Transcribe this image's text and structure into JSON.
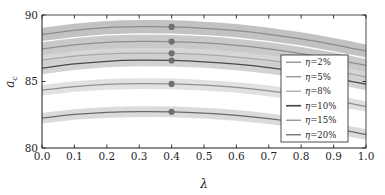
{
  "chart_data": {
    "type": "line",
    "title": "",
    "xlabel": "λ",
    "ylabel": "a_c",
    "xlim": [
      0.0,
      1.0
    ],
    "ylim": [
      80,
      90
    ],
    "grid": false,
    "legend_position": "center-right",
    "xticks": [
      "0.0",
      "0.1",
      "0.2",
      "0.3",
      "0.4",
      "0.5",
      "0.6",
      "0.7",
      "0.8",
      "0.9",
      "1.0"
    ],
    "xtick_values": [
      0.0,
      0.1,
      0.2,
      0.3,
      0.4,
      0.5,
      0.6,
      0.7,
      0.8,
      0.9,
      1.0
    ],
    "yticks": [
      "80",
      "85",
      "90"
    ],
    "ytick_values": [
      80,
      85,
      90
    ],
    "x": [
      0.0,
      0.1,
      0.2,
      0.3,
      0.4,
      0.5,
      0.6,
      0.7,
      0.8,
      0.9,
      1.0
    ],
    "marker_x": 0.4,
    "series": [
      {
        "name": "η=2%",
        "eta": "2%",
        "color": "#8d8d8d",
        "band_color": "#bdbdbd",
        "values": [
          88.55,
          88.85,
          89.05,
          89.12,
          89.1,
          89.0,
          88.82,
          88.55,
          88.2,
          87.78,
          87.3
        ],
        "band_low": [
          88.05,
          88.35,
          88.55,
          88.62,
          88.6,
          88.5,
          88.32,
          88.05,
          87.7,
          87.28,
          86.8
        ],
        "band_high": [
          89.05,
          89.35,
          89.55,
          89.62,
          89.6,
          89.5,
          89.32,
          89.05,
          88.7,
          88.28,
          87.8
        ],
        "marker_value": 89.1
      },
      {
        "name": "η=5%",
        "eta": "5%",
        "color": "#8f8f8f",
        "band_color": "#c4c4c4",
        "values": [
          87.45,
          87.75,
          87.95,
          88.02,
          88.0,
          87.9,
          87.72,
          87.45,
          87.1,
          86.68,
          86.2
        ],
        "band_low": [
          86.95,
          87.25,
          87.45,
          87.52,
          87.5,
          87.4,
          87.22,
          86.95,
          86.6,
          86.18,
          85.7
        ],
        "band_high": [
          87.95,
          88.25,
          88.45,
          88.52,
          88.5,
          88.4,
          88.22,
          87.95,
          87.6,
          87.18,
          86.7
        ],
        "marker_value": 88.0
      },
      {
        "name": "η=8%",
        "eta": "8%",
        "color": "#a8a8a8",
        "band_color": "#d3d3d3",
        "values": [
          86.6,
          86.9,
          87.08,
          87.14,
          87.12,
          87.02,
          86.84,
          86.58,
          86.24,
          85.82,
          85.35
        ],
        "band_low": [
          86.2,
          86.5,
          86.68,
          86.74,
          86.72,
          86.62,
          86.44,
          86.18,
          85.84,
          85.42,
          84.95
        ],
        "band_high": [
          87.0,
          87.3,
          87.48,
          87.54,
          87.52,
          87.42,
          87.24,
          86.98,
          86.64,
          86.22,
          85.75
        ],
        "marker_value": 87.12
      },
      {
        "name": "η=10%",
        "eta": "10%",
        "color": "#4a4a4a",
        "band_color": "#cfcfcf",
        "values": [
          86.0,
          86.32,
          86.52,
          86.6,
          86.58,
          86.48,
          86.3,
          86.04,
          85.7,
          85.28,
          84.8
        ],
        "band_low": [
          85.55,
          85.87,
          86.07,
          86.15,
          86.13,
          86.03,
          85.85,
          85.59,
          85.25,
          84.83,
          84.35
        ],
        "band_high": [
          86.45,
          86.77,
          86.97,
          87.05,
          87.03,
          86.93,
          86.75,
          86.49,
          86.15,
          85.73,
          85.25
        ],
        "marker_value": 86.58
      },
      {
        "name": "η=15%",
        "eta": "15%",
        "color": "#909090",
        "band_color": "#dedede",
        "values": [
          84.35,
          84.62,
          84.78,
          84.84,
          84.82,
          84.72,
          84.55,
          84.3,
          83.98,
          83.58,
          83.12
        ],
        "band_low": [
          83.95,
          84.22,
          84.38,
          84.44,
          84.42,
          84.32,
          84.15,
          83.9,
          83.58,
          83.18,
          82.72
        ],
        "band_high": [
          84.75,
          85.02,
          85.18,
          85.24,
          85.22,
          85.12,
          84.95,
          84.7,
          84.38,
          83.98,
          83.52
        ],
        "marker_value": 84.82
      },
      {
        "name": "η=20%",
        "eta": "20%",
        "color": "#6a6a6a",
        "band_color": "#d8d8d8",
        "values": [
          82.25,
          82.52,
          82.68,
          82.74,
          82.72,
          82.62,
          82.45,
          82.2,
          81.88,
          81.48,
          81.02
        ],
        "band_low": [
          81.85,
          82.12,
          82.28,
          82.34,
          82.32,
          82.22,
          82.05,
          81.8,
          81.48,
          81.08,
          80.62
        ],
        "band_high": [
          82.65,
          82.92,
          83.08,
          83.14,
          83.12,
          83.02,
          82.85,
          82.6,
          82.28,
          81.88,
          81.42
        ],
        "marker_value": 82.72
      }
    ],
    "marker_color": "#6b6b6b",
    "axis_color": "#1f1f1f",
    "background": "#ffffff"
  },
  "legend": {
    "entries": [
      {
        "label": "η=2%"
      },
      {
        "label": "η=5%"
      },
      {
        "label": "η=8%"
      },
      {
        "label": "η=10%"
      },
      {
        "label": "η=15%"
      },
      {
        "label": "η=20%"
      }
    ]
  },
  "axes": {
    "x_title": "λ",
    "y_title_base": "a",
    "y_title_sub": "c"
  }
}
